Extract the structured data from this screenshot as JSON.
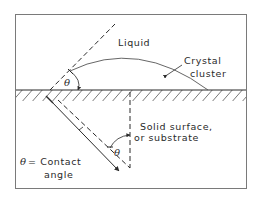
{
  "diagram": {
    "type": "contact-angle-schematic",
    "labels": {
      "liquid": "Liquid",
      "crystal_cluster_line1": "Crystal",
      "crystal_cluster_line2": "cluster",
      "solid_line1": "Solid surface,",
      "solid_line2": "or substrate",
      "contact_line1": "= Contact",
      "contact_line2": "angle",
      "theta_symbol": "θ"
    },
    "colors": {
      "stroke": "#2a2a2a",
      "frame": "#7a7a7a",
      "background": "#ffffff"
    }
  }
}
